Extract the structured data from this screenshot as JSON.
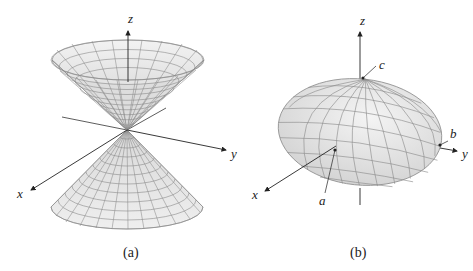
{
  "figure": {
    "panel_a": {
      "caption": "(a)",
      "surface": "double cone",
      "axis_labels": {
        "x": "x",
        "y": "y",
        "z": "z"
      }
    },
    "panel_b": {
      "caption": "(b)",
      "surface": "ellipsoid",
      "axis_labels": {
        "x": "x",
        "y": "y",
        "z": "z"
      },
      "intercept_labels": {
        "a": "a",
        "b": "b",
        "c": "c"
      }
    },
    "colors": {
      "surface_fill": "#ececec",
      "surface_shade": "#d6d6d6",
      "grid_line": "#8a8a8a",
      "axis": "#222222"
    }
  }
}
